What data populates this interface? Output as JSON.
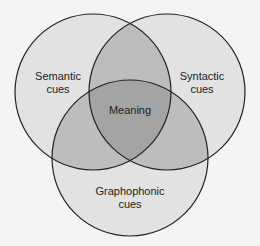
{
  "diagram": {
    "type": "venn",
    "circles": [
      {
        "id": "semantic",
        "label_line1": "Semantic",
        "label_line2": "cues"
      },
      {
        "id": "syntactic",
        "label_line1": "Syntactic",
        "label_line2": "cues"
      },
      {
        "id": "graphophonic",
        "label_line1": "Graphophonic",
        "label_line2": "cues"
      }
    ],
    "center_label": "Meaning",
    "colors": {
      "single": "#e2e2e2",
      "pair": "#bdbdbd",
      "center": "#a4a4a4",
      "stroke": "#222222"
    }
  }
}
